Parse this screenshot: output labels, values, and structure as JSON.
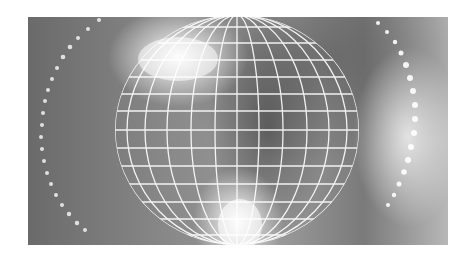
{
  "image": {
    "description": "Grayscale abstract graphic of a white wireframe globe with glowing light flares and curved dotted arcs of light",
    "palette": {
      "background": "#ffffff",
      "dark": "#5a5a5a",
      "mid": "#8c8c8c",
      "light": "#e8e8e8",
      "grid": "#ffffff"
    },
    "elements": [
      "wireframe-globe",
      "light-flare-top",
      "light-flare-bottom",
      "dotted-arc-left",
      "dotted-arc-right"
    ]
  }
}
